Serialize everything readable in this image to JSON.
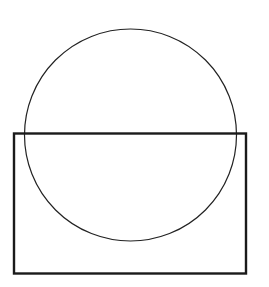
{
  "canvas": {
    "width": 269,
    "height": 287,
    "background": "#ffffff"
  },
  "shapes": {
    "circle": {
      "cx": 130.5,
      "cy": 135,
      "r": 106,
      "stroke": "#222222",
      "stroke_width": 1.2,
      "fill": "none"
    },
    "rectangle": {
      "x": 14,
      "y": 133.5,
      "width": 232,
      "height": 140,
      "stroke": "#1a1a1a",
      "stroke_width": 2.4,
      "fill": "none"
    }
  }
}
